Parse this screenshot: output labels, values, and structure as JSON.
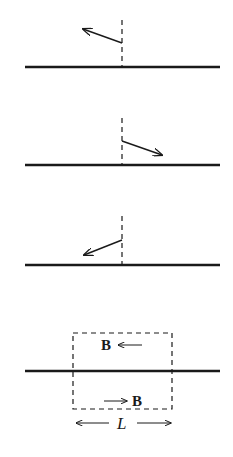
{
  "diagram": {
    "colors": {
      "ink": "#1a1a1a",
      "background": "#ffffff"
    },
    "panels": [
      {
        "id": 1,
        "surface_y": 67,
        "normal_x": 122,
        "normal_top": 20,
        "arrow": {
          "from": [
            122,
            43
          ],
          "to": [
            83,
            29
          ],
          "direction": "up-left"
        }
      },
      {
        "id": 2,
        "surface_y": 165,
        "normal_x": 122,
        "normal_top": 118,
        "arrow": {
          "from": [
            122,
            141
          ],
          "to": [
            162,
            155
          ],
          "direction": "down-right"
        }
      },
      {
        "id": 3,
        "surface_y": 265,
        "normal_x": 122,
        "normal_top": 215,
        "arrow": {
          "from": [
            122,
            240
          ],
          "to": [
            84,
            255
          ],
          "direction": "down-left"
        }
      },
      {
        "id": 4,
        "surface_y": 371,
        "loop": {
          "x1": 73,
          "y1": 333,
          "x2": 172,
          "y2": 409
        }
      }
    ],
    "labels": {
      "field_top": "B",
      "field_bottom": "B",
      "length": "L"
    }
  }
}
